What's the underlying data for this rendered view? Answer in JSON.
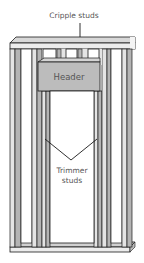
{
  "diagram": {
    "labels": {
      "cripple_studs": "Cripple studs",
      "header": "Header",
      "trimmer_line1": "Trimmer",
      "trimmer_line2": "studs"
    },
    "colors": {
      "wood_light": "#e4e4e4",
      "wood_mid": "#b4b4b4",
      "header_fill": "#bcbcbc",
      "outline": "#1a1a1a",
      "text": "#555555"
    }
  }
}
